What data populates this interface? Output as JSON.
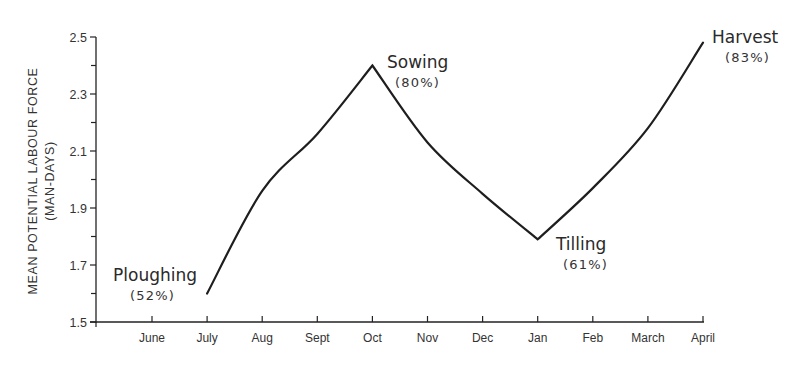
{
  "chart_data": {
    "type": "line",
    "title": "",
    "xlabel": "",
    "ylabel": "MEAN POTENTIAL LABOUR FORCE",
    "ylabel_sub": "(MAN-DAYS)",
    "ylim": [
      1.5,
      2.5
    ],
    "grid": false,
    "y_ticks": [
      "1.5",
      "1.7",
      "1.9",
      "2.1",
      "2.3",
      "2.5"
    ],
    "y_minor_ticks": [
      1.6,
      1.8,
      2.0,
      2.2,
      2.4
    ],
    "categories": [
      "June",
      "July",
      "Aug",
      "Sept",
      "Oct",
      "Nov",
      "Dec",
      "Jan",
      "Feb",
      "March",
      "April"
    ],
    "series": [
      {
        "name": "Mean potential labour force",
        "x": [
          "July",
          "Aug",
          "Sept",
          "Oct",
          "Nov",
          "Dec",
          "Jan",
          "Feb",
          "March",
          "April"
        ],
        "values": [
          1.6,
          1.96,
          2.16,
          2.4,
          2.13,
          1.95,
          1.79,
          1.97,
          2.18,
          2.48
        ]
      }
    ],
    "annotations": [
      {
        "label": "Ploughing",
        "pct": "(52%)",
        "at": "July"
      },
      {
        "label": "Sowing",
        "pct": "(80%)",
        "at": "Oct"
      },
      {
        "label": "Tilling",
        "pct": "(61%)",
        "at": "Jan"
      },
      {
        "label": "Harvest",
        "pct": "(83%)",
        "at": "April"
      }
    ]
  }
}
